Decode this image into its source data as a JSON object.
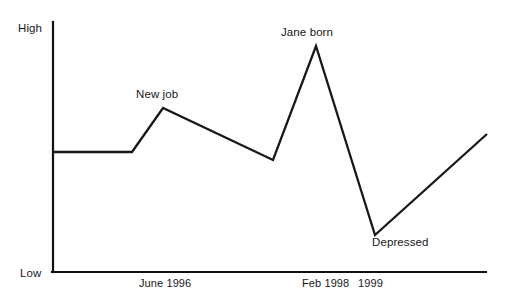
{
  "chart_data": {
    "type": "line",
    "title": "",
    "subtitle": "",
    "xlabel": "",
    "ylabel": "",
    "grid": false,
    "legend": "none",
    "axis_y_labels": {
      "high": "High",
      "low": "Low"
    },
    "ylim": [
      "Low",
      "High"
    ],
    "x_tick_labels": [
      "June 1996",
      "Feb 1998",
      "1999"
    ],
    "x_tick_positions_px": [
      185,
      326,
      372
    ],
    "series": [
      {
        "name": "Mood",
        "color": "#16181c",
        "points": [
          {
            "x_px": 53,
            "y_px": 152,
            "level": 0.55,
            "label": ""
          },
          {
            "x_px": 132,
            "y_px": 152,
            "level": 0.55,
            "label": ""
          },
          {
            "x_px": 163,
            "y_px": 108,
            "level": 0.73,
            "label": "New job"
          },
          {
            "x_px": 273,
            "y_px": 160,
            "level": 0.52,
            "label": ""
          },
          {
            "x_px": 316,
            "y_px": 46,
            "level": 0.96,
            "label": "Jane born"
          },
          {
            "x_px": 375,
            "y_px": 235,
            "level": 0.17,
            "label": "Depressed"
          },
          {
            "x_px": 487,
            "y_px": 134,
            "level": 0.62,
            "label": ""
          }
        ]
      }
    ],
    "annotations": [
      {
        "text": "New job",
        "x_px": 136,
        "y_px": 89,
        "anchor": "above-peak"
      },
      {
        "text": "Jane born",
        "x_px": 281,
        "y_px": 27,
        "anchor": "above-peak"
      },
      {
        "text": "Depressed",
        "x_px": 372,
        "y_px": 237,
        "anchor": "below-valley"
      }
    ],
    "axes": {
      "y_axis": {
        "x_px": 53,
        "y_top_px": 22,
        "y_bottom_px": 272
      },
      "x_axis": {
        "y_px": 272,
        "x_left_px": 53,
        "x_right_px": 486
      }
    },
    "colors": {
      "background": "#ffffff",
      "line": "#16181c",
      "axis": "#111111",
      "text": "#17181b"
    }
  }
}
